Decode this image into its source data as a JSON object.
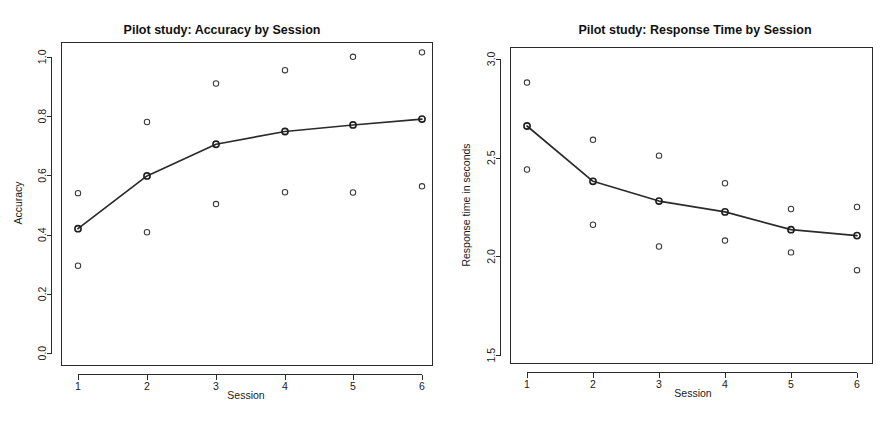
{
  "page": {
    "background_color": "#ffffff",
    "width": 890,
    "height": 427
  },
  "panels": [
    {
      "id": "accuracy",
      "title": "Pilot study: Accuracy by Session",
      "xlabel": "Session",
      "ylabel": "Accuracy"
    },
    {
      "id": "response-time",
      "title": "Pilot study: Response Time by Session",
      "xlabel": "Session",
      "ylabel": "Response time in seconds"
    }
  ],
  "chart_data": [
    {
      "type": "scatter",
      "id": "accuracy",
      "title": "Pilot study: Accuracy by Session",
      "xlabel": "Session",
      "ylabel": "Accuracy",
      "xlim": [
        0.78,
        6.25
      ],
      "ylim": [
        -0.04,
        1.05
      ],
      "xticks": [
        1,
        2,
        3,
        4,
        5,
        6
      ],
      "xtick_labels": [
        "1",
        "2",
        "3",
        "4",
        "5",
        "6"
      ],
      "yticks": [
        0.0,
        0.2,
        0.4,
        0.6,
        0.8,
        1.0
      ],
      "ytick_labels": [
        "0.0",
        "0.2",
        "0.4",
        "0.6",
        "0.8",
        "1.0"
      ],
      "grid": false,
      "legend": "none",
      "x": [
        1,
        2,
        3,
        4,
        5,
        6
      ],
      "series": [
        {
          "name": "Subject A (upper)",
          "marker": "open-circle",
          "values": [
            0.54,
            0.78,
            0.91,
            0.955,
            1.0,
            1.015
          ]
        },
        {
          "name": "Mean accuracy",
          "marker": "circle-with-line",
          "line": true,
          "values": [
            0.42,
            0.598,
            0.705,
            0.748,
            0.77,
            0.79
          ]
        },
        {
          "name": "Subject B (lower)",
          "marker": "open-circle",
          "values": [
            0.295,
            0.408,
            0.503,
            0.543,
            0.542,
            0.563
          ]
        }
      ]
    },
    {
      "type": "scatter",
      "id": "response-time",
      "title": "Pilot study: Response Time by Session",
      "xlabel": "Session",
      "ylabel": "Response time in seconds",
      "xlim": [
        0.78,
        6.25
      ],
      "ylim": [
        1.46,
        3.06
      ],
      "xticks": [
        1,
        2,
        3,
        4,
        5,
        6
      ],
      "xtick_labels": [
        "1",
        "2",
        "3",
        "4",
        "5",
        "6"
      ],
      "yticks": [
        1.5,
        2.0,
        2.5,
        3.0
      ],
      "ytick_labels": [
        "1.5",
        "2.0",
        "2.5",
        "3.0"
      ],
      "grid": false,
      "legend": "none",
      "x": [
        1,
        2,
        3,
        4,
        5,
        6
      ],
      "series": [
        {
          "name": "Subject A (upper)",
          "marker": "open-circle",
          "values": [
            2.88,
            2.59,
            2.51,
            2.37,
            2.24,
            2.25
          ]
        },
        {
          "name": "Mean response time",
          "marker": "circle-with-line",
          "line": true,
          "values": [
            2.66,
            2.38,
            2.28,
            2.225,
            2.135,
            2.105
          ]
        },
        {
          "name": "Subject B (lower)",
          "marker": "open-circle",
          "values": [
            2.44,
            2.16,
            2.05,
            2.08,
            2.02,
            1.93
          ]
        }
      ]
    }
  ]
}
